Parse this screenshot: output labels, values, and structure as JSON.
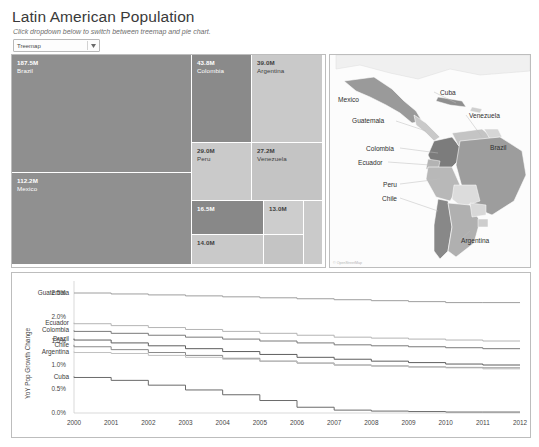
{
  "header": {
    "title": "Latin American Population",
    "subtitle": "Click dropdown below to switch between treemap and pie chart.",
    "dropdown": {
      "value": "Treemap",
      "icon": "chevron-down-icon"
    }
  },
  "map": {
    "attribution": "© OpenStreetMap",
    "labels": [
      {
        "name": "Mexico",
        "x": 8,
        "y": 41
      },
      {
        "name": "Cuba",
        "x": 110,
        "y": 34
      },
      {
        "name": "Guatemala",
        "x": 22,
        "y": 62
      },
      {
        "name": "Venezuela",
        "x": 139,
        "y": 57
      },
      {
        "name": "Colombia",
        "x": 36,
        "y": 90
      },
      {
        "name": "Ecuador",
        "x": 28,
        "y": 104
      },
      {
        "name": "Brazil",
        "x": 160,
        "y": 89
      },
      {
        "name": "Peru",
        "x": 53,
        "y": 126
      },
      {
        "name": "Chile",
        "x": 52,
        "y": 140
      },
      {
        "name": "Argentina",
        "x": 131,
        "y": 182
      }
    ]
  },
  "chart_data": [
    {
      "type": "treemap",
      "title": "Latin American Population",
      "value_unit": "M",
      "nodes": [
        {
          "label": "Brazil",
          "value": "187.5M",
          "population": 187.5,
          "tone": "dark"
        },
        {
          "label": "Mexico",
          "value": "112.2M",
          "population": 112.2,
          "tone": "dark"
        },
        {
          "label": "Colombia",
          "value": "43.8M",
          "population": 43.8,
          "tone": "dark"
        },
        {
          "label": "Argentina",
          "value": "39.0M",
          "population": 39.0,
          "tone": "light"
        },
        {
          "label": "Peru",
          "value": "29.0M",
          "population": 29.0,
          "tone": "light"
        },
        {
          "label": "Venezuela",
          "value": "27.2M",
          "population": 27.2,
          "tone": "light"
        },
        {
          "label": "",
          "value": "16.5M",
          "population": 16.5,
          "tone": "dark"
        },
        {
          "label": "",
          "value": "13.0M",
          "population": 13.0,
          "tone": "light"
        },
        {
          "label": "",
          "value": "14.0M",
          "population": 14.0,
          "tone": "light"
        }
      ]
    },
    {
      "type": "line",
      "title": "",
      "xlabel": "",
      "ylabel": "YoY Pop Growth Change",
      "x": [
        2000,
        2001,
        2002,
        2003,
        2004,
        2005,
        2006,
        2007,
        2008,
        2009,
        2010,
        2011,
        2012
      ],
      "xticks": [
        "2000",
        "2001",
        "2002",
        "2003",
        "2004",
        "2005",
        "2006",
        "2007",
        "2008",
        "2009",
        "2010",
        "2011",
        "2012"
      ],
      "yticks": [
        "0.0%",
        "0.5%",
        "1.0%",
        "1.5%",
        "2.0%",
        "2.5%"
      ],
      "ylim": [
        0.0,
        2.75
      ],
      "grid": false,
      "legend": "inline-left-labels",
      "series": [
        {
          "name": "Guatemala",
          "values": [
            2.5,
            2.5,
            2.48,
            2.46,
            2.44,
            2.42,
            2.4,
            2.38,
            2.36,
            2.34,
            2.32,
            2.3,
            2.3
          ]
        },
        {
          "name": "Ecuador",
          "values": [
            1.88,
            1.86,
            1.82,
            1.78,
            1.74,
            1.7,
            1.66,
            1.62,
            1.58,
            1.56,
            1.54,
            1.52,
            1.5
          ]
        },
        {
          "name": "Colombia",
          "values": [
            1.72,
            1.7,
            1.66,
            1.62,
            1.58,
            1.54,
            1.5,
            1.46,
            1.42,
            1.4,
            1.38,
            1.36,
            1.34
          ]
        },
        {
          "name": "Brazil",
          "values": [
            1.55,
            1.52,
            1.46,
            1.4,
            1.34,
            1.28,
            1.22,
            1.16,
            1.12,
            1.08,
            1.05,
            1.02,
            1.0
          ]
        },
        {
          "name": "Chile",
          "values": [
            1.42,
            1.38,
            1.32,
            1.26,
            1.2,
            1.14,
            1.08,
            1.04,
            1.0,
            0.98,
            0.96,
            0.95,
            0.94
          ]
        },
        {
          "name": "Argentina",
          "values": [
            1.28,
            1.26,
            1.24,
            1.2,
            1.16,
            1.12,
            1.08,
            1.04,
            1.0,
            0.98,
            0.96,
            0.94,
            0.92
          ]
        },
        {
          "name": "Cuba",
          "values": [
            0.76,
            0.74,
            0.68,
            0.58,
            0.48,
            0.38,
            0.26,
            0.12,
            0.06,
            0.04,
            0.03,
            0.02,
            0.02
          ]
        }
      ]
    }
  ]
}
